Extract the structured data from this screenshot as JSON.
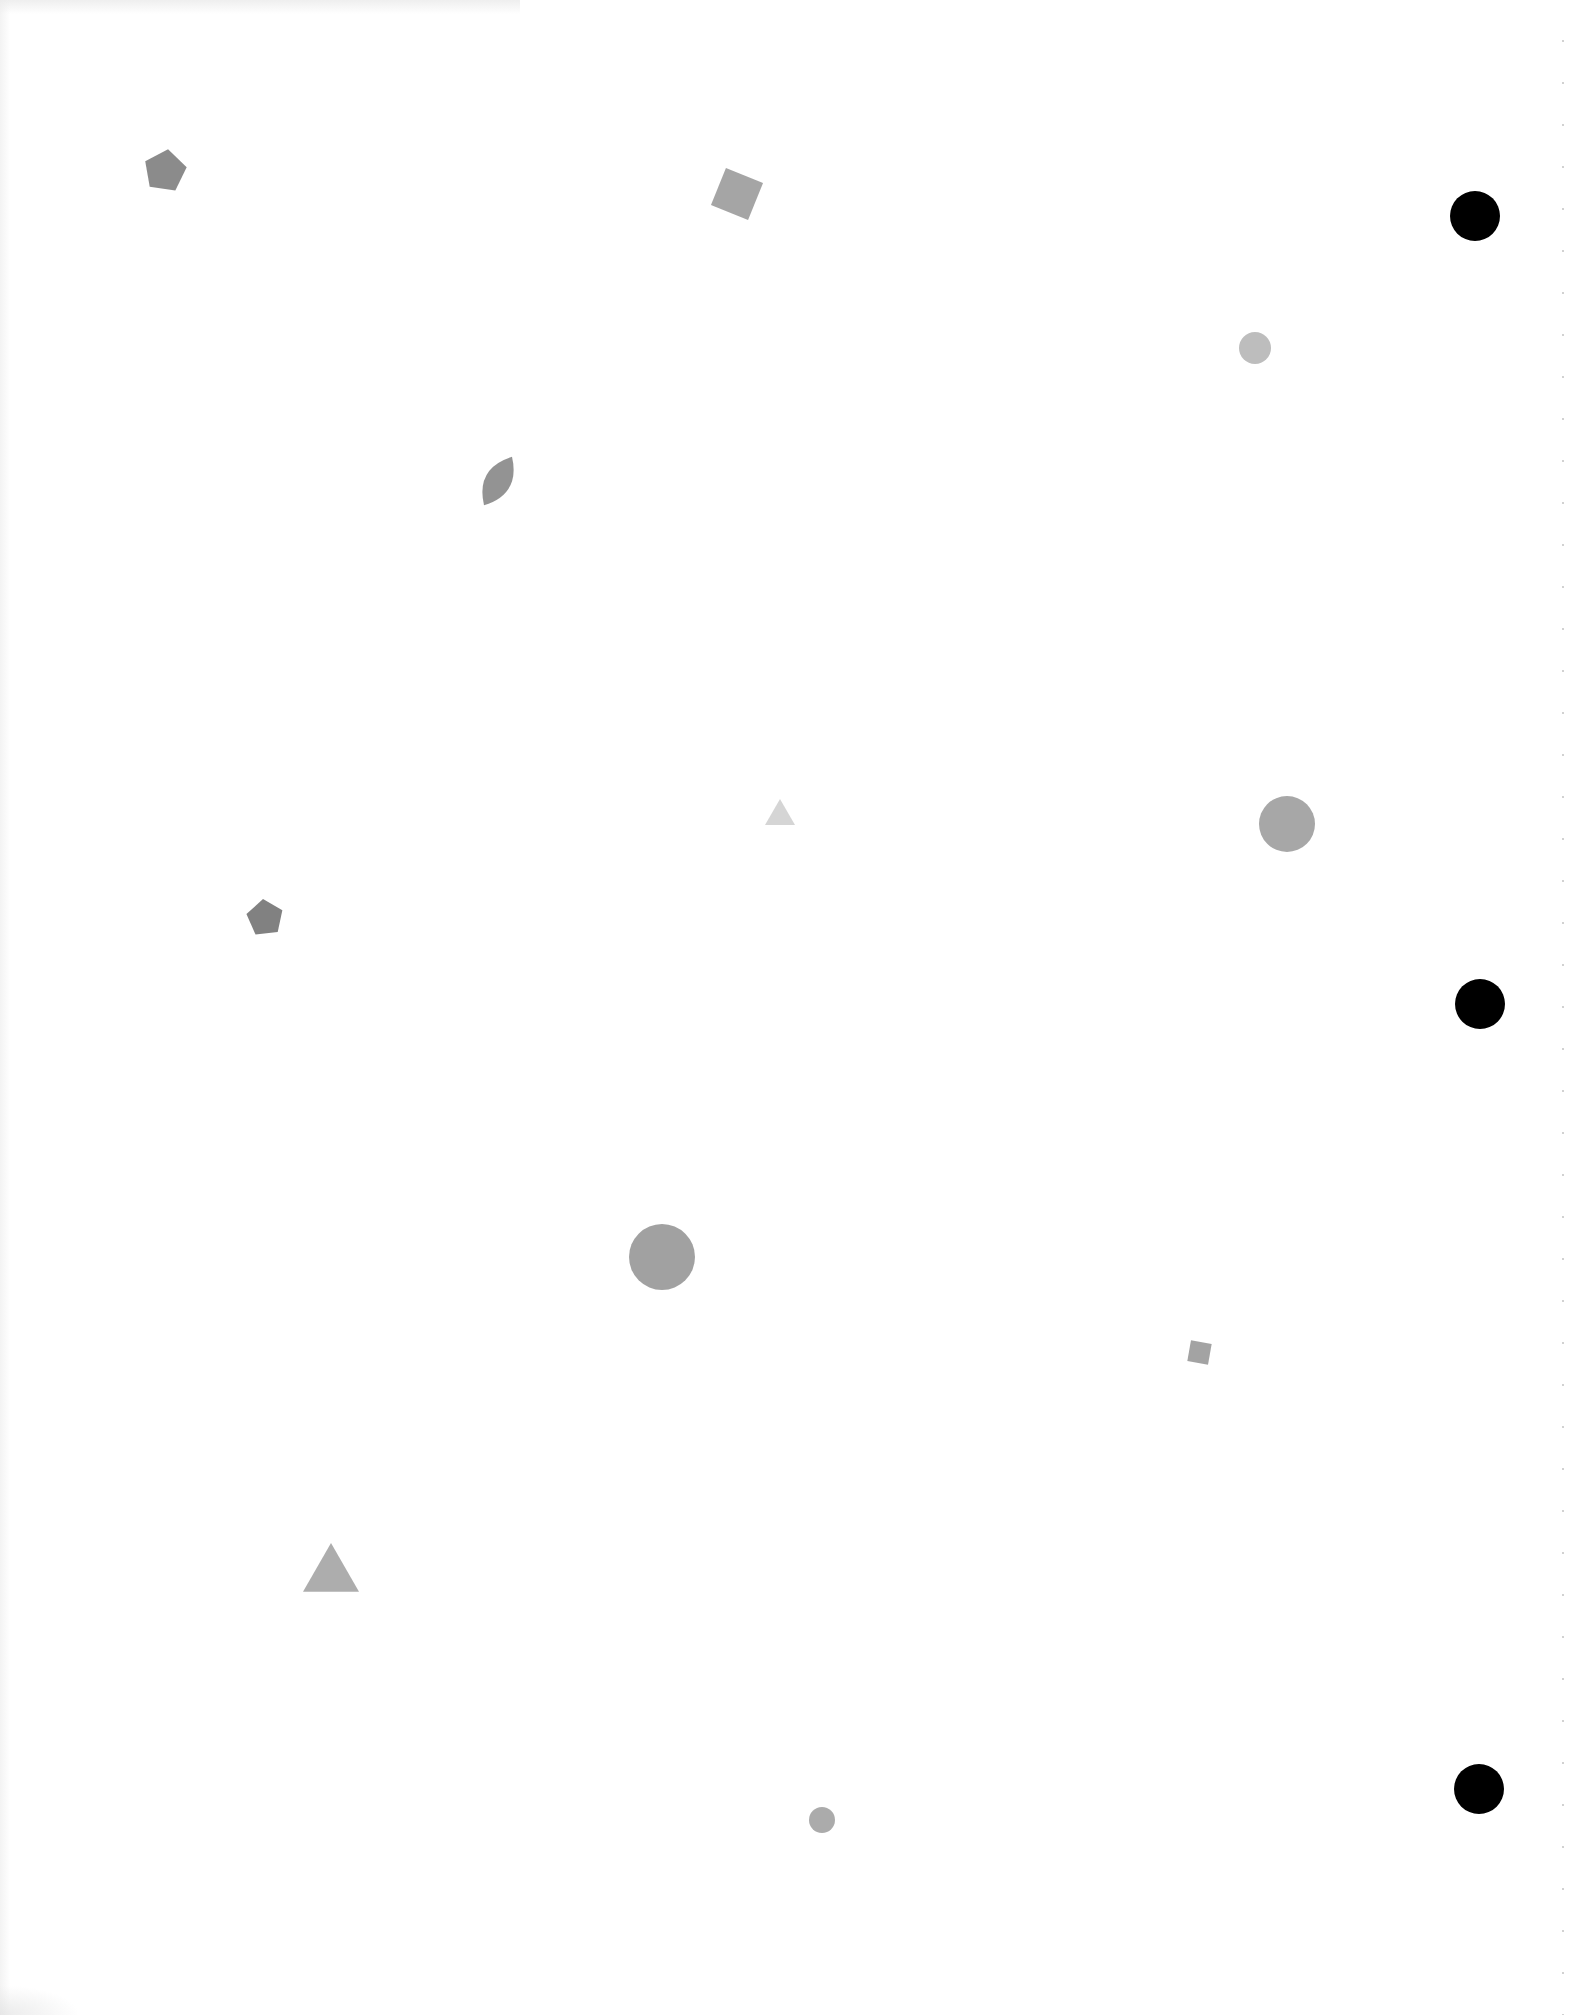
{
  "page": {
    "background": "#ffffff",
    "width": 1588,
    "height": 2015
  },
  "colors": {
    "shape_grey": "#8f8f8f",
    "shape_grey_dark": "#7e7e7e",
    "shape_grey_light": "#d4d4d4",
    "shape_grey_mid": "#a4a4a4",
    "hole_black": "#000000"
  },
  "binder_holes": [
    {
      "name": "binder-hole-top",
      "cx": 1475,
      "cy": 216,
      "r": 25
    },
    {
      "name": "binder-hole-middle",
      "cx": 1480,
      "cy": 1004,
      "r": 25
    },
    {
      "name": "binder-hole-bottom",
      "cx": 1479,
      "cy": 1789,
      "r": 25
    }
  ],
  "shapes": [
    {
      "name": "pentagon-shape",
      "type": "pentagon",
      "cx": 165,
      "cy": 171,
      "size": 44,
      "rotation": 8,
      "color": "#858585"
    },
    {
      "name": "square-shape",
      "type": "square",
      "cx": 737,
      "cy": 194,
      "size": 40,
      "rotation": 22,
      "color": "#a0a0a0"
    },
    {
      "name": "textured-circle-small",
      "type": "circle",
      "cx": 1255,
      "cy": 348,
      "r": 16,
      "color": "#b9b9b9"
    },
    {
      "name": "leaf-shape",
      "type": "leaf",
      "cx": 498,
      "cy": 481,
      "w": 40,
      "h": 56,
      "rotation": 30,
      "color": "#8d8d8d"
    },
    {
      "name": "triangle-shape-light",
      "type": "triangle",
      "cx": 780,
      "cy": 812,
      "size": 30,
      "color": "#d3d3d3"
    },
    {
      "name": "circle-shape-medium",
      "type": "circle",
      "cx": 1287,
      "cy": 824,
      "r": 28,
      "color": "#a2a2a2"
    },
    {
      "name": "pentagon-shape-small",
      "type": "pentagon",
      "cx": 265,
      "cy": 918,
      "size": 38,
      "rotation": -6,
      "color": "#7a7a7a"
    },
    {
      "name": "textured-circle-large",
      "type": "circle",
      "cx": 662,
      "cy": 1257,
      "r": 33,
      "color": "#9c9c9c"
    },
    {
      "name": "square-shape-small",
      "type": "square",
      "cx": 1199,
      "cy": 1352,
      "size": 21,
      "rotation": 10,
      "color": "#9e9e9e"
    },
    {
      "name": "triangle-shape",
      "type": "triangle",
      "cx": 331,
      "cy": 1567,
      "size": 56,
      "color": "#a9a9a9"
    },
    {
      "name": "circle-shape-small",
      "type": "circle",
      "cx": 822,
      "cy": 1820,
      "r": 13,
      "color": "#a6a6a6"
    }
  ]
}
